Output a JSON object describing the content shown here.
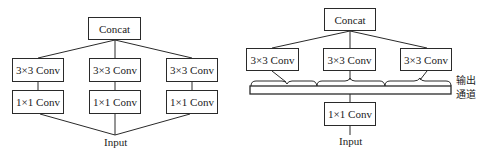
{
  "left_diagram": {
    "top": "Concat",
    "branches": [
      {
        "upper": "3×3 Conv",
        "lower": "1×1 Conv"
      },
      {
        "upper": "3×3 Conv",
        "lower": "1×1 Conv"
      },
      {
        "upper": "3×3 Conv",
        "lower": "1×1 Conv"
      }
    ],
    "input": "Input"
  },
  "right_diagram": {
    "top": "Concat",
    "branches": [
      "3×3 Conv",
      "3×3 Conv",
      "3×3 Conv"
    ],
    "bottleneck": "1×1 Conv",
    "channel_label_line1": "输出",
    "channel_label_line2": "通道",
    "input": "Input"
  },
  "colors": {
    "stroke": "#2a2a2a",
    "background": "#ffffff"
  }
}
